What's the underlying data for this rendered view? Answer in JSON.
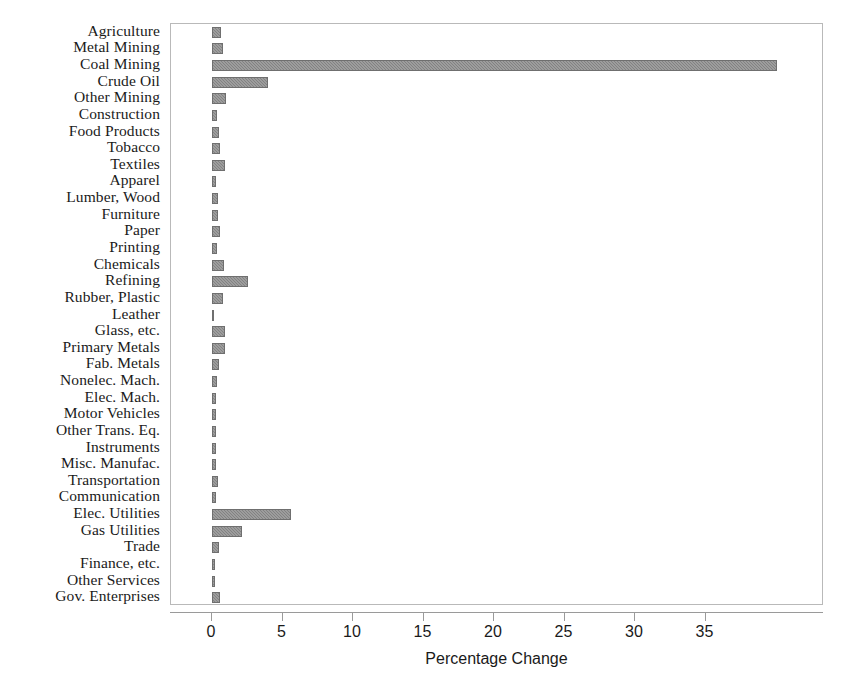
{
  "chart_data": {
    "type": "bar",
    "orientation": "horizontal",
    "title": "",
    "xlabel": "Percentage Change",
    "ylabel": "",
    "xlim": [
      0,
      41.5
    ],
    "ylim": null,
    "grid": false,
    "legend": null,
    "xticks": [
      0,
      5,
      10,
      15,
      20,
      25,
      30,
      35
    ],
    "xtick_labels": [
      "0",
      "5",
      "10",
      "15",
      "20",
      "25",
      "30",
      "35"
    ],
    "bar_color": "#828282",
    "categories": [
      "Agriculture",
      "Metal Mining",
      "Coal Mining",
      "Crude Oil",
      "Other Mining",
      "Construction",
      "Food Products",
      "Tobacco",
      "Textiles",
      "Apparel",
      "Lumber, Wood",
      "Furniture",
      "Paper",
      "Printing",
      "Chemicals",
      "Refining",
      "Rubber, Plastic",
      "Leather",
      "Glass, etc.",
      "Primary Metals",
      "Fab. Metals",
      "Nonelec. Mach.",
      "Elec. Mach.",
      "Motor Vehicles",
      "Other Trans. Eq.",
      "Instruments",
      "Misc. Manufac.",
      "Transportation",
      "Communication",
      "Elec. Utilities",
      "Gas Utilities",
      "Trade",
      "Finance, etc.",
      "Other Services",
      "Gov. Enterprises"
    ],
    "values": [
      0.65,
      0.75,
      40.1,
      4.0,
      1.0,
      0.35,
      0.5,
      0.6,
      0.95,
      0.3,
      0.4,
      0.4,
      0.6,
      0.35,
      0.85,
      2.55,
      0.75,
      0.15,
      0.9,
      0.95,
      0.5,
      0.35,
      0.3,
      0.25,
      0.3,
      0.25,
      0.3,
      0.45,
      0.25,
      5.6,
      2.1,
      0.5,
      0.2,
      0.2,
      0.6
    ]
  }
}
